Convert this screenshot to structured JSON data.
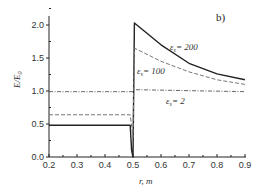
{
  "chart_data": {
    "type": "line",
    "title": "",
    "panel_label": "b)",
    "xlabel": "r, m",
    "ylabel": "E/E0",
    "xlim": [
      0.2,
      0.9
    ],
    "ylim": [
      0.0,
      2.2
    ],
    "x_ticks": [
      "0.2",
      "0.3",
      "0.4",
      "0.5",
      "0.6",
      "0.7",
      "0.8",
      "0.9"
    ],
    "y_ticks": [
      "0.0",
      "0.5",
      "1.0",
      "1.5",
      "2.0"
    ],
    "grid": false,
    "series": [
      {
        "name": "εs = 200",
        "style": "solid",
        "x": [
          0.2,
          0.49,
          0.495,
          0.5,
          0.505,
          0.6,
          0.7,
          0.8,
          0.9
        ],
        "y": [
          0.48,
          0.48,
          0.1,
          0.0,
          2.03,
          1.7,
          1.42,
          1.26,
          1.17
        ]
      },
      {
        "name": "εs = 100",
        "style": "dashed",
        "x": [
          0.2,
          0.49,
          0.5,
          0.505,
          0.6,
          0.7,
          0.8,
          0.9
        ],
        "y": [
          0.64,
          0.64,
          0.3,
          1.65,
          1.45,
          1.29,
          1.17,
          1.1
        ]
      },
      {
        "name": "εs = 2",
        "style": "dash-dot",
        "x": [
          0.2,
          0.5,
          0.505,
          0.9
        ],
        "y": [
          0.99,
          0.99,
          1.02,
          0.99
        ]
      }
    ],
    "annotations": [
      {
        "text": "εs = 200",
        "x": 0.64,
        "y": 1.62
      },
      {
        "text": "εs = 100",
        "x": 0.53,
        "y": 1.28
      },
      {
        "text": "εs = 2",
        "x": 0.63,
        "y": 0.85
      }
    ]
  },
  "labels": {
    "panel": "b)",
    "xlabel": "r, m",
    "ylabel": "E/E",
    "ylabel_sub": "0",
    "ann200": "= 200",
    "ann100": "= 100",
    "ann2": "= 2",
    "eps": "ε",
    "eps_sub": "s"
  }
}
